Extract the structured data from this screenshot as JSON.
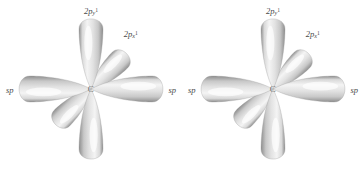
{
  "figure": {
    "type": "orbital-diagram",
    "background_color": "#ffffff",
    "lobe_color_light": "#f4f4f4",
    "lobe_color_mid": "#c8c8c8",
    "lobe_color_dark": "#8e8e8e",
    "label_color": "#4a4a4a",
    "panel_count": 2
  },
  "panels": [
    {
      "id": "panel-left",
      "atom": "C",
      "labels": {
        "py": {
          "base": "2p",
          "sub": "y",
          "sup": "1"
        },
        "px": {
          "base": "2p",
          "sub": "x",
          "sup": "1"
        },
        "sp_left": "sp",
        "sp_right": "sp"
      },
      "orbitals": [
        {
          "name": "sp-left",
          "angle": 180,
          "length": 74,
          "width": 26,
          "label": "sp"
        },
        {
          "name": "sp-right",
          "angle": 0,
          "length": 74,
          "width": 26,
          "label": "sp"
        },
        {
          "name": "2py-up",
          "angle": 270,
          "length": 72,
          "width": 24,
          "label": "2p y 1"
        },
        {
          "name": "2py-down",
          "angle": 90,
          "length": 72,
          "width": 24,
          "label": ""
        },
        {
          "name": "2px-upright",
          "angle": 315,
          "length": 52,
          "width": 22,
          "label": "2p x 1"
        },
        {
          "name": "2px-downleft",
          "angle": 135,
          "length": 52,
          "width": 22,
          "label": ""
        }
      ]
    },
    {
      "id": "panel-right",
      "atom": "C",
      "labels": {
        "py": {
          "base": "2p",
          "sub": "y",
          "sup": "1"
        },
        "px": {
          "base": "2p",
          "sub": "x",
          "sup": "1"
        },
        "sp_left": "sp",
        "sp_right": "sp"
      },
      "orbitals": [
        {
          "name": "sp-left",
          "angle": 180,
          "length": 74,
          "width": 26,
          "label": "sp"
        },
        {
          "name": "sp-right",
          "angle": 0,
          "length": 74,
          "width": 26,
          "label": "sp"
        },
        {
          "name": "2py-up",
          "angle": 270,
          "length": 72,
          "width": 24,
          "label": "2p y 1"
        },
        {
          "name": "2py-down",
          "angle": 90,
          "length": 72,
          "width": 24,
          "label": ""
        },
        {
          "name": "2px-upright",
          "angle": 315,
          "length": 52,
          "width": 22,
          "label": "2p x 1"
        },
        {
          "name": "2px-downleft",
          "angle": 135,
          "length": 52,
          "width": 22,
          "label": ""
        }
      ]
    }
  ]
}
